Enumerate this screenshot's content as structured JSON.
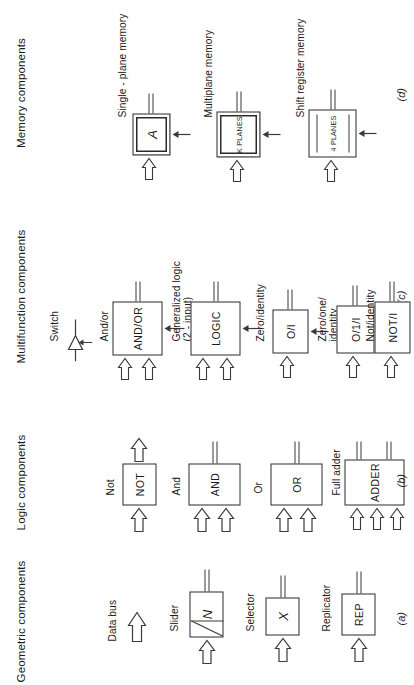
{
  "figure": {
    "orientation": "rotated-90-ccw",
    "ink_color": "#2b2b2b",
    "columns": [
      {
        "id": "geometric",
        "title": "Geometric components",
        "fignum": "(a)",
        "items": [
          {
            "id": "data-bus",
            "caption": "Data bus",
            "box_label": "",
            "box_style": "none"
          },
          {
            "id": "slider",
            "caption": "Slider",
            "box_label": "N",
            "box_style": "slider"
          },
          {
            "id": "selector",
            "caption": "Selector",
            "box_label": "X",
            "box_style": "italic"
          },
          {
            "id": "replicator",
            "caption": "Replicator",
            "box_label": "REP",
            "box_style": "plain"
          }
        ]
      },
      {
        "id": "logic",
        "title": "Logic components",
        "fignum": "(b)",
        "items": [
          {
            "id": "not",
            "caption": "Not",
            "box_label": "NOT",
            "box_style": "plain"
          },
          {
            "id": "and",
            "caption": "And",
            "box_label": "AND",
            "box_style": "plain"
          },
          {
            "id": "or",
            "caption": "Or",
            "box_label": "OR",
            "box_style": "plain"
          },
          {
            "id": "full-adder",
            "caption": "Full adder",
            "box_label": "ADDER",
            "box_style": "plain"
          }
        ]
      },
      {
        "id": "multifunction",
        "title": "Multifunction components",
        "fignum": "(c)",
        "items": [
          {
            "id": "switch",
            "caption": "Switch",
            "box_label": "",
            "box_style": "switch"
          },
          {
            "id": "and-or",
            "caption": "And/or",
            "box_label": "AND/OR",
            "box_style": "plain"
          },
          {
            "id": "generalized-logic",
            "caption": "Generalized logic",
            "caption2": "(2 - input)",
            "box_label": "LOGIC",
            "box_style": "plain"
          },
          {
            "id": "zero-identity",
            "caption": "Zero/identity",
            "box_label": "O/I",
            "box_style": "plain"
          },
          {
            "id": "zero-one-identity",
            "caption": "Zero/one/",
            "caption2": "identity",
            "box_label": "O/1/I",
            "box_style": "plain"
          },
          {
            "id": "not-identity",
            "caption": "Not/identity",
            "box_label": "NOT/I",
            "box_style": "plain"
          }
        ]
      },
      {
        "id": "memory",
        "title": "Memory components",
        "fignum": "(d)",
        "items": [
          {
            "id": "single-plane-memory",
            "caption": "Single - plane memory",
            "box_label": "A",
            "box_style": "italic-double"
          },
          {
            "id": "multiplane-memory",
            "caption": "Multiplane memory",
            "box_label": "K PLANES",
            "box_style": "tiny-double"
          },
          {
            "id": "shift-register-memory",
            "caption": "Shift register memory",
            "box_label": "4 PLANES",
            "box_style": "tiny-lined"
          }
        ]
      }
    ]
  }
}
